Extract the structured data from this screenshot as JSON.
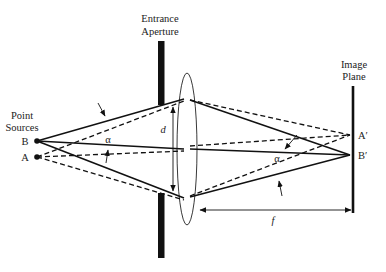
{
  "labels": {
    "entrance_aperture_line1": "Entrance",
    "entrance_aperture_line2": "Aperture",
    "image_plane_line1": "Image",
    "image_plane_line2": "Plane",
    "point_sources_line1": "Point",
    "point_sources_line2": "Sources",
    "point_b": "B",
    "point_a": "A",
    "image_a": "A′",
    "image_b": "B′",
    "aperture_diameter": "d",
    "focal_length": "f",
    "angle_left": "α",
    "angle_right": "α"
  },
  "colors": {
    "line": "#111111",
    "background": "#ffffff"
  },
  "geometry": {
    "point_b": [
      37,
      141
    ],
    "point_a": [
      37,
      157
    ],
    "lens_center": [
      187,
      149
    ],
    "image_a": [
      350,
      135
    ],
    "image_b": [
      350,
      155
    ]
  }
}
